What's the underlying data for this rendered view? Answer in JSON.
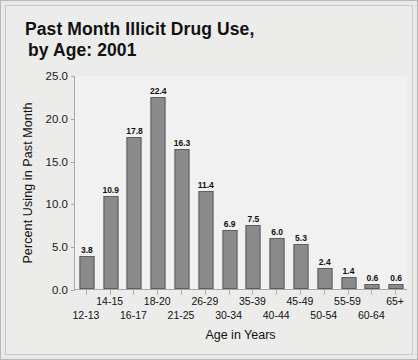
{
  "chart_data": {
    "type": "bar",
    "title": "Past Month Illicit Drug Use, by Age: 2001",
    "title_lines": [
      "Past Month Illicit Drug Use,",
      "by Age: 2001"
    ],
    "categories": [
      "12-13",
      "14-15",
      "16-17",
      "18-20",
      "21-25",
      "26-29",
      "30-34",
      "35-39",
      "40-44",
      "45-49",
      "50-54",
      "55-59",
      "60-64",
      "65+"
    ],
    "values": [
      3.8,
      10.9,
      17.8,
      22.4,
      16.3,
      11.4,
      6.9,
      7.5,
      6.0,
      5.3,
      2.4,
      1.4,
      0.6,
      0.6
    ],
    "value_labels": [
      "3.8",
      "10.9",
      "17.8",
      "22.4",
      "16.3",
      "11.4",
      "6.9",
      "7.5",
      "6.0",
      "5.3",
      "2.4",
      "1.4",
      "0.6",
      "0.6"
    ],
    "xlabel": "Age in Years",
    "ylabel": "Percent Using in Past Month",
    "ylim": [
      0.0,
      25.0
    ],
    "ytick_values": [
      0.0,
      5.0,
      10.0,
      15.0,
      20.0,
      25.0
    ],
    "ytick_labels": [
      "0.0",
      "5.0",
      "10.0",
      "15.0",
      "20.0",
      "25.0"
    ],
    "grid": false,
    "legend": null,
    "bar_color": "#8a8a8a",
    "bar_border_color": "#5e5e5e",
    "plot_background": "#f1f1f1",
    "card_background": "#ececeb",
    "text_color": "#111111"
  }
}
